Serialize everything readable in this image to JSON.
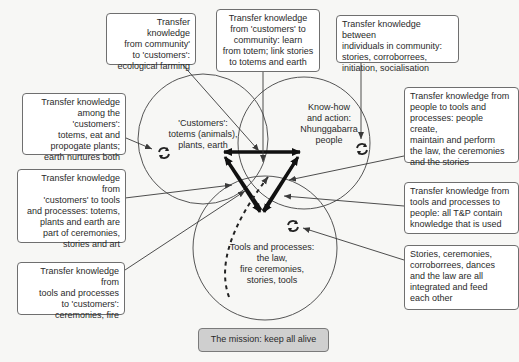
{
  "colors": {
    "background": "#f7f7f5",
    "box_fill": "#ffffff",
    "box_border": "#6f6f6f",
    "line": "#3a3a3a",
    "thick_arrow": "#111111",
    "mission_fill": "#cfcfcf"
  },
  "circles": {
    "customers": {
      "label": "'Customers':\ntotems (animals),\nplants, earth"
    },
    "people": {
      "label": "Know-how\nand action:\nNhunggabarra\npeople"
    },
    "tools": {
      "label": "Tools and processes:\nthe law,\nfire ceremonies,\nstories, tools"
    }
  },
  "boxes": {
    "community_to_customers": "Transfer knowledge\nfrom community'\nto 'customers':\necological farming",
    "customers_to_community": "Transfer knowledge\nfrom 'customers' to\ncommunity: learn\nfrom totem; link stories\nto totems and earth",
    "between_individuals": "Transfer knowledge between\nindividuals in community:\nstories, corroborrees,\ninitiation, socialisation",
    "among_customers": "Transfer knowledge\namong the 'customers':\ntotems, eat and\npropogate plants;\nearth nurtures both",
    "customers_to_tools": "Transfer knowledge from\n'customers' to tools\nand processes: totems,\nplants and earth are\npart of ceremonies,\nstories and art",
    "tools_to_customers": "Transfer knowledge from\ntools and processes\nto 'customers':\nceremonies, fire",
    "people_to_tools": "Transfer knowledge from\npeople to tools and\nprocesses: people create,\nmaintain and perform\nthe law, the ceremonies\nand the stories",
    "tools_to_people": "Transfer knowledge from\ntools and processes to\npeople: all T&P contain\nknowledge that is used",
    "integrated": "Stories, ceremonies,\ncorroborrees, dances\nand the law are all\nintegrated and feed\neach other"
  },
  "mission": {
    "label": "The mission: keep all alive"
  },
  "icons": {
    "cycle_icon": "circular-arrows-icon"
  }
}
